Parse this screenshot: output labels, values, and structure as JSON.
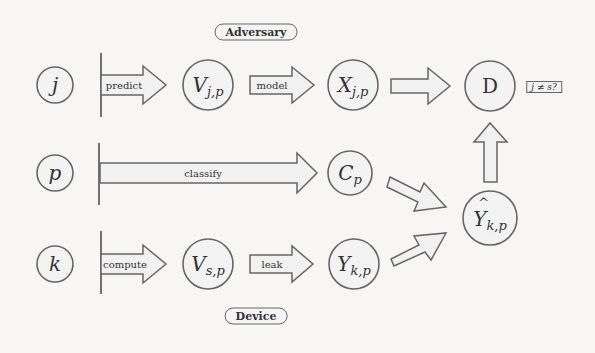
{
  "roles": {
    "adversary_label": "Adversary",
    "device_label": "Device"
  },
  "inputs": [
    {
      "id": "j",
      "label": "j"
    },
    {
      "id": "p",
      "label": "p"
    },
    {
      "id": "k",
      "label": "k"
    }
  ],
  "nodes": {
    "v_jp": {
      "base": "V",
      "sub": "j,p"
    },
    "x_jp": {
      "base": "X",
      "sub": "j,p"
    },
    "d": {
      "label": "D"
    },
    "c_p": {
      "base": "C",
      "sub": "p"
    },
    "v_sp": {
      "base": "V",
      "sub": "s,p"
    },
    "y_kp": {
      "base": "Y",
      "sub": "k,p"
    },
    "y_hat_kp": {
      "base": "Y",
      "sub": "k,p",
      "accent": "hat"
    }
  },
  "arrows": {
    "predict": "predict",
    "model": "model",
    "classify": "classify",
    "compute": "compute",
    "leak": "leak"
  },
  "condition": "j ≠ s?",
  "colors": {
    "stroke": "#666666",
    "arrow_fill": "#f1f1f1",
    "background": "#f7f6f3"
  }
}
